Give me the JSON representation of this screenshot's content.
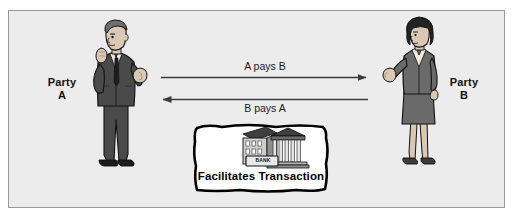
{
  "diagram": {
    "title_text": "",
    "frame": {
      "background_color": "#ececec",
      "border_color": "#9a9a9a"
    },
    "actors": [
      {
        "id": "party-a",
        "label_line1": "Party",
        "label_line2": "A",
        "icon": "businessman-figure",
        "side": "left"
      },
      {
        "id": "party-b",
        "label_line1": "Party",
        "label_line2": "B",
        "icon": "businesswoman-figure",
        "side": "right"
      }
    ],
    "flows": [
      {
        "id": "a-pays-b",
        "label": "A pays B",
        "direction": "right",
        "label_position": "above"
      },
      {
        "id": "b-pays-a",
        "label": "B pays A",
        "direction": "left",
        "label_position": "below"
      }
    ],
    "callout": {
      "id": "bank-callout",
      "caption": "Facilitates Transaction",
      "icon": "bank-building-icon",
      "sign_text": "BANK",
      "shape": "hand-drawn-rounded-box",
      "fill_color": "#ffffff",
      "stroke_color": "#000000"
    },
    "colors": {
      "suit_dark": "#4a4a4a",
      "suit_darker": "#3a3a3a",
      "skin": "#d8c8b4",
      "hair_dark": "#2b2b2b",
      "hair_mid": "#555555",
      "line": "#3b3b3b",
      "text": "#101010",
      "bank_roof": "#4f4f4f",
      "bank_wall": "#cfcfcf"
    }
  }
}
